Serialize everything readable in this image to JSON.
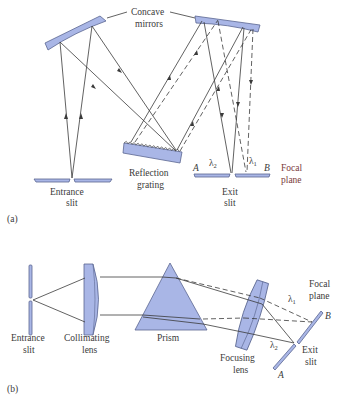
{
  "figure": {
    "panel_a": {
      "label": "(a)",
      "mirrors_label_line1": "Concave",
      "mirrors_label_line2": "mirrors",
      "grating_label_line1": "Reflection",
      "grating_label_line2": "grating",
      "entrance_label_line1": "Entrance",
      "entrance_label_line2": "slit",
      "exit_label_line1": "Exit",
      "exit_label_line2": "slit",
      "focal_label_line1": "Focal",
      "focal_label_line2": "plane",
      "point_a": "A",
      "point_b": "B",
      "lambda1": "λ",
      "lambda1_sub": "1",
      "lambda2": "λ",
      "lambda2_sub": "2"
    },
    "panel_b": {
      "label": "(b)",
      "entrance_label_line1": "Entrance",
      "entrance_label_line2": "slit",
      "collimating_label_line1": "Collimating",
      "collimating_label_line2": "lens",
      "prism_label": "Prism",
      "focusing_label_line1": "Focusing",
      "focusing_label_line2": "lens",
      "focal_label_line1": "Focal",
      "focal_label_line2": "plane",
      "exit_label_line1": "Exit",
      "exit_label_line2": "slit",
      "point_a": "A",
      "point_b": "B",
      "lambda1": "λ",
      "lambda1_sub": "1",
      "lambda2": "λ",
      "lambda2_sub": "2"
    },
    "colors": {
      "optic_fill": "#a9b6e6",
      "optic_stroke": "#5a6690",
      "line": "#3a3a3a",
      "focal_text_a": "#7a3a3a"
    }
  }
}
